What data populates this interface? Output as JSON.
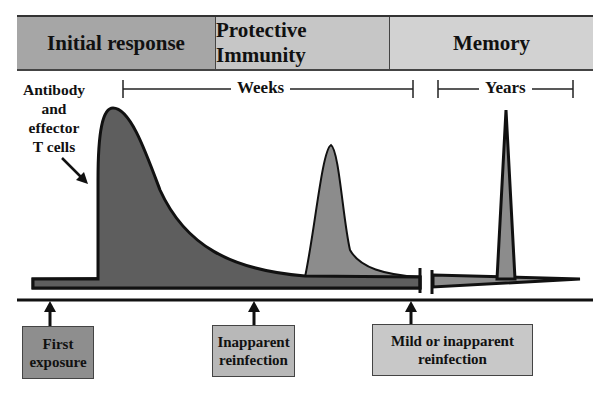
{
  "header": {
    "phases": [
      {
        "label": "Initial response",
        "color": "#a6a6a6"
      },
      {
        "label": "Protective Immunity",
        "color": "#c6c6c6"
      },
      {
        "label": "Memory",
        "color": "#d2d2d2"
      }
    ]
  },
  "curve_label": {
    "lines": [
      "Antibody",
      "and",
      "effector",
      "T cells"
    ]
  },
  "time_ranges": {
    "weeks": "Weeks",
    "years": "Years"
  },
  "events": [
    {
      "label_line1": "First",
      "label_line2": "exposure",
      "color": "#8e8e8e"
    },
    {
      "label_line1": "Inapparent",
      "label_line2": "reinfection",
      "color": "#b8b8b8"
    },
    {
      "label_line1": "Mild or inapparent",
      "label_line2": "reinfection",
      "color": "#c8c8c8"
    }
  ],
  "colors": {
    "primary_peak": "#5e5e5e",
    "secondary_peak": "#8c8c8c",
    "baseline_band": "#6a6a6a",
    "outline": "#111111"
  }
}
